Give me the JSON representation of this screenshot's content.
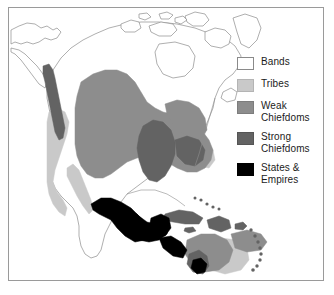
{
  "figure": {
    "frame_color": "#9a9a9a",
    "background": "#ffffff"
  },
  "legend": {
    "name": "map-legend",
    "items": [
      {
        "label": "Bands",
        "color": "#ffffff",
        "border": "#8a8a8a",
        "swatch_name": "legend-swatch-bands"
      },
      {
        "label": "Tribes",
        "color": "#c9c9c9",
        "border": "#b4b4b4",
        "swatch_name": "legend-swatch-tribes"
      },
      {
        "label": "Weak\nChiefdoms",
        "color": "#8d8d8d",
        "border": "#7d7d7d",
        "swatch_name": "legend-swatch-weak-chiefdoms"
      },
      {
        "label": "Strong\nChiefdoms",
        "color": "#636363",
        "border": "#555555",
        "swatch_name": "legend-swatch-strong-chiefdoms"
      },
      {
        "label": "States &\nEmpires",
        "color": "#000000",
        "border": "#000000",
        "swatch_name": "legend-swatch-states-empires"
      }
    ]
  },
  "map": {
    "name": "north-america-political-complexity-map",
    "coastline_color": "#8d8d8d",
    "regions": [
      {
        "name": "arctic-canada",
        "category": "Bands",
        "color": "#ffffff"
      },
      {
        "name": "alaska",
        "category": "Bands",
        "color": "#ffffff"
      },
      {
        "name": "pacific-northwest-coast",
        "category": "Strong Chiefdoms",
        "color": "#636363"
      },
      {
        "name": "great-basin-california",
        "category": "Tribes",
        "color": "#c9c9c9"
      },
      {
        "name": "plains-and-southwest",
        "category": "Weak Chiefdoms",
        "color": "#8d8d8d"
      },
      {
        "name": "eastern-woodlands",
        "category": "Weak Chiefdoms",
        "color": "#8d8d8d"
      },
      {
        "name": "mississippi-valley",
        "category": "Strong Chiefdoms",
        "color": "#636363"
      },
      {
        "name": "mesoamerica",
        "category": "States & Empires",
        "color": "#000000"
      },
      {
        "name": "greater-antilles",
        "category": "Strong Chiefdoms",
        "color": "#636363"
      },
      {
        "name": "lesser-antilles-arc",
        "category": "Strong Chiefdoms",
        "color": "#636363"
      },
      {
        "name": "northern-south-america",
        "category": "Weak Chiefdoms",
        "color": "#8d8d8d"
      },
      {
        "name": "andes-northern-edge",
        "category": "States & Empires",
        "color": "#000000"
      }
    ]
  }
}
